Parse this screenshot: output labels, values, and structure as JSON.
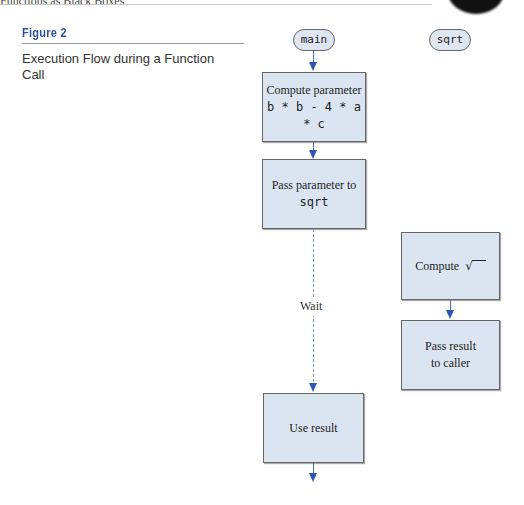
{
  "page_header": {
    "cropped_text": "Functions as Black Boxes"
  },
  "figure": {
    "label": "Figure 2",
    "caption": "Execution Flow during a Function Call"
  },
  "diagram": {
    "lanes": [
      {
        "name": "main",
        "label": "main"
      },
      {
        "name": "sqrt",
        "label": "sqrt"
      }
    ],
    "main_steps": [
      {
        "line1": "Compute parameter",
        "line2": "b * b - 4 * a * c"
      },
      {
        "line1": "Pass parameter to",
        "line2": "sqrt"
      },
      {
        "line1": "Use result"
      }
    ],
    "wait_label": "Wait",
    "sqrt_steps": [
      {
        "line1": "Compute",
        "symbol": "√"
      },
      {
        "line1": "Pass result",
        "line2": "to caller"
      }
    ]
  },
  "colors": {
    "figure_label": "#2c4f9e",
    "box_fill": "#dbe5f1",
    "arrow": "#2f56b5"
  }
}
